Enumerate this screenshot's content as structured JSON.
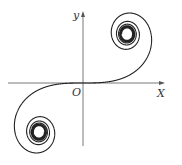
{
  "diagram": {
    "type": "Cornu (Euler) spiral",
    "axes": {
      "x_label": "X",
      "y_label": "y",
      "origin_label": "O",
      "origin": [
        83,
        83
      ],
      "x_range_px": [
        8,
        165
      ],
      "y_range_px": [
        11,
        146
      ]
    },
    "curve": {
      "color": "#222222",
      "scale_x": 88,
      "scale_y": 98,
      "t_max": 5.2
    },
    "colors": {
      "axis": "#555555",
      "curve": "#222222",
      "background": "#ffffff"
    }
  }
}
